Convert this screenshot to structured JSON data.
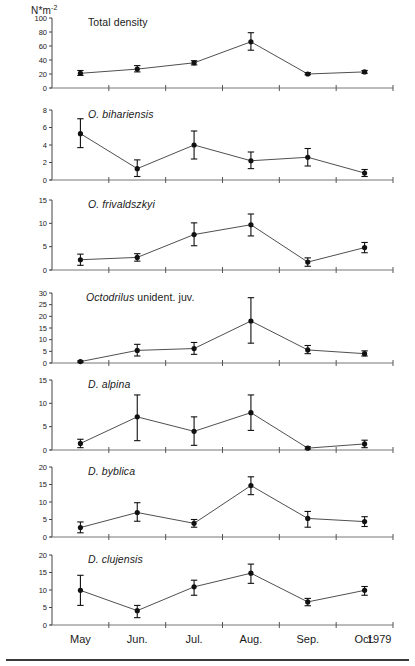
{
  "figure": {
    "unit_label": "N*m",
    "unit_exponent": "-2",
    "year_label": "1979",
    "xlabel_months": [
      "May",
      "Jun.",
      "Jul.",
      "Aug.",
      "Sep.",
      "Oct."
    ],
    "accent_color": "#111111",
    "line_color": "#3b3b3b",
    "axis_color": "#666666"
  },
  "chart_data": [
    {
      "type": "line",
      "title": "Total density",
      "title_italic_prefix": "",
      "title_plain": "Total density",
      "categories": [
        "May",
        "Jun.",
        "Jul.",
        "Aug.",
        "Sep.",
        "Oct."
      ],
      "values": [
        21,
        27,
        36,
        66,
        20,
        23
      ],
      "err_low": [
        18,
        23,
        33,
        54,
        19,
        21
      ],
      "err_high": [
        25,
        32,
        39,
        79,
        22,
        25
      ],
      "yticks": [
        0,
        20,
        40,
        60,
        80,
        100
      ],
      "ylim": [
        0,
        100
      ],
      "ylabel": "N*m-2",
      "xlabel": "",
      "grid": false,
      "legend": "none"
    },
    {
      "type": "line",
      "title": "O. bihariensis",
      "title_italic_prefix": "O. bihariensis",
      "title_plain": "",
      "categories": [
        "May",
        "Jun.",
        "Jul.",
        "Aug.",
        "Sep.",
        "Oct."
      ],
      "values": [
        5.3,
        1.3,
        4.0,
        2.2,
        2.6,
        0.8
      ],
      "err_low": [
        3.7,
        0.4,
        2.4,
        1.3,
        1.6,
        0.4
      ],
      "err_high": [
        7.0,
        2.3,
        5.6,
        3.2,
        3.6,
        1.2
      ],
      "yticks": [
        0,
        2,
        4,
        6,
        8
      ],
      "ylim": [
        0,
        8
      ],
      "ylabel": "",
      "xlabel": "",
      "grid": false,
      "legend": "none"
    },
    {
      "type": "line",
      "title": "O. frivaldszkyi",
      "title_italic_prefix": "O. frivaldszkyi",
      "title_plain": "",
      "categories": [
        "May",
        "Jun.",
        "Jul.",
        "Aug.",
        "Sep.",
        "Oct."
      ],
      "values": [
        2.2,
        2.7,
        7.6,
        9.7,
        1.7,
        4.8
      ],
      "err_low": [
        1.0,
        1.9,
        5.2,
        7.3,
        0.8,
        3.7
      ],
      "err_high": [
        3.4,
        3.5,
        10.1,
        12.0,
        2.6,
        5.9
      ],
      "yticks": [
        0,
        5,
        10,
        15
      ],
      "ylim": [
        0,
        15
      ],
      "ylabel": "",
      "xlabel": "",
      "grid": false,
      "legend": "none"
    },
    {
      "type": "line",
      "title": "Octodrilus unident. juv.",
      "title_italic_prefix": "Octodrilus",
      "title_plain": " unident. juv.",
      "categories": [
        "May",
        "Jun.",
        "Jul.",
        "Aug.",
        "Sep.",
        "Oct."
      ],
      "values": [
        0.6,
        5.4,
        6.2,
        18.0,
        5.6,
        4.0
      ],
      "err_low": [
        0.3,
        3.0,
        3.7,
        8.5,
        4.0,
        3.0
      ],
      "err_high": [
        0.9,
        8.0,
        8.8,
        28.0,
        7.5,
        5.2
      ],
      "yticks": [
        0,
        5,
        10,
        15,
        20,
        25,
        30
      ],
      "ylim": [
        0,
        30
      ],
      "ylabel": "",
      "xlabel": "",
      "grid": false,
      "legend": "none"
    },
    {
      "type": "line",
      "title": "D. alpina",
      "title_italic_prefix": "D. alpina",
      "title_plain": "",
      "categories": [
        "May",
        "Jun.",
        "Jul.",
        "Aug.",
        "Sep.",
        "Oct."
      ],
      "values": [
        1.4,
        7.1,
        4.0,
        8.0,
        0.4,
        1.3
      ],
      "err_low": [
        0.5,
        2.0,
        1.0,
        4.2,
        0.2,
        0.5
      ],
      "err_high": [
        2.3,
        11.8,
        7.1,
        11.8,
        0.7,
        2.1
      ],
      "yticks": [
        0,
        5,
        10,
        15
      ],
      "ylim": [
        0,
        15
      ],
      "ylabel": "",
      "xlabel": "",
      "grid": false,
      "legend": "none"
    },
    {
      "type": "line",
      "title": "D. byblica",
      "title_italic_prefix": "D. byblica",
      "title_plain": "",
      "categories": [
        "May",
        "Jun.",
        "Jul.",
        "Aug.",
        "Sep.",
        "Oct."
      ],
      "values": [
        2.7,
        7.0,
        3.9,
        14.7,
        5.3,
        4.4
      ],
      "err_low": [
        1.2,
        4.5,
        2.8,
        12.1,
        2.8,
        3.0
      ],
      "err_high": [
        4.3,
        9.8,
        5.0,
        17.2,
        7.3,
        5.8
      ],
      "yticks": [
        0,
        5,
        10,
        15,
        20
      ],
      "ylim": [
        0,
        20
      ],
      "ylabel": "",
      "xlabel": "",
      "grid": false,
      "legend": "none"
    },
    {
      "type": "line",
      "title": "D. clujensis",
      "title_italic_prefix": "D. clujensis",
      "title_plain": "",
      "categories": [
        "May",
        "Jun.",
        "Jul.",
        "Aug.",
        "Sep.",
        "Oct."
      ],
      "values": [
        9.9,
        4.1,
        10.9,
        14.8,
        6.6,
        9.9
      ],
      "err_low": [
        5.6,
        2.1,
        8.5,
        11.9,
        5.5,
        8.5
      ],
      "err_high": [
        14.2,
        5.6,
        12.8,
        17.4,
        7.6,
        11.0
      ],
      "yticks": [
        0,
        5,
        10,
        15,
        20
      ],
      "ylim": [
        0,
        20
      ],
      "ylabel": "",
      "xlabel": "",
      "grid": false,
      "legend": "none"
    }
  ],
  "panel_titles": [
    {
      "italic": "",
      "plain": "Total density"
    },
    {
      "italic": "O. bihariensis",
      "plain": ""
    },
    {
      "italic": "O. frivaldszkyi",
      "plain": ""
    },
    {
      "italic": "Octodrilus",
      "plain": " unident. juv."
    },
    {
      "italic": "D. alpina",
      "plain": ""
    },
    {
      "italic": "D. byblica",
      "plain": ""
    },
    {
      "italic": "D. clujensis",
      "plain": ""
    }
  ]
}
